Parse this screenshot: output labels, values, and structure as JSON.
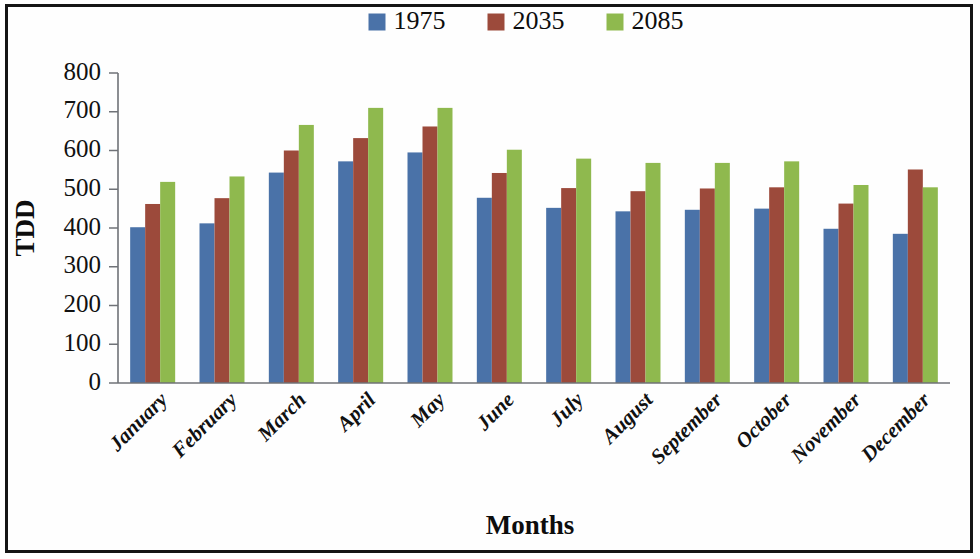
{
  "chart_data": {
    "type": "bar",
    "title": "",
    "xlabel": "Months",
    "ylabel": "TDD",
    "categories": [
      "January",
      "February",
      "March",
      "April",
      "May",
      "June",
      "July",
      "August",
      "September",
      "October",
      "November",
      "December"
    ],
    "series": [
      {
        "name": "1975",
        "color": "#4a72a8",
        "values": [
          402,
          412,
          543,
          572,
          595,
          478,
          452,
          443,
          447,
          450,
          398,
          385
        ]
      },
      {
        "name": "2035",
        "color": "#9c4a3b",
        "values": [
          462,
          477,
          600,
          632,
          662,
          542,
          503,
          495,
          502,
          505,
          463,
          551
        ]
      },
      {
        "name": "2085",
        "color": "#8fb94e",
        "values": [
          519,
          533,
          666,
          710,
          710,
          602,
          579,
          568,
          568,
          572,
          511,
          505
        ]
      }
    ],
    "ylim": [
      0,
      800
    ],
    "yticks": [
      0,
      100,
      200,
      300,
      400,
      500,
      600,
      700,
      800
    ],
    "ytick_labels": [
      "0",
      "100",
      "200",
      "300",
      "400",
      "500",
      "600",
      "700",
      "800"
    ],
    "grid": false,
    "legend_position": "top-center",
    "category_label_rotation": -45
  },
  "legend": {
    "entries": [
      {
        "label": "1975",
        "color": "#4a72a8"
      },
      {
        "label": "2035",
        "color": "#9c4a3b"
      },
      {
        "label": "2085",
        "color": "#8fb94e"
      }
    ]
  },
  "frame": {
    "border_color": "#141414",
    "background": "#fefefe"
  }
}
